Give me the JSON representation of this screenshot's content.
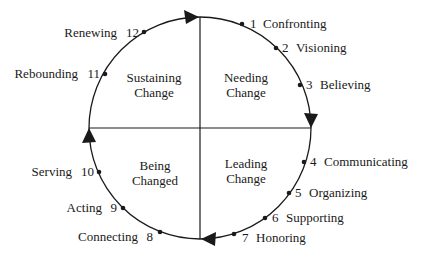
{
  "diagram": {
    "type": "change-cycle",
    "quadrants": [
      {
        "id": "needing",
        "line1": "Needing",
        "line2": "Change"
      },
      {
        "id": "leading",
        "line1": "Leading",
        "line2": "Change"
      },
      {
        "id": "being",
        "line1": "Being",
        "line2": "Changed"
      },
      {
        "id": "sustaining",
        "line1": "Sustaining",
        "line2": "Change"
      }
    ],
    "steps": [
      {
        "n": "1",
        "label": "Confronting"
      },
      {
        "n": "2",
        "label": "Visioning"
      },
      {
        "n": "3",
        "label": "Believing"
      },
      {
        "n": "4",
        "label": "Communicating"
      },
      {
        "n": "5",
        "label": "Organizing"
      },
      {
        "n": "6",
        "label": "Supporting"
      },
      {
        "n": "7",
        "label": "Honoring"
      },
      {
        "n": "8",
        "label": "Connecting"
      },
      {
        "n": "9",
        "label": "Acting"
      },
      {
        "n": "10",
        "label": "Serving"
      },
      {
        "n": "11",
        "label": "Rebounding"
      },
      {
        "n": "12",
        "label": "Renewing"
      }
    ],
    "colors": {
      "stroke": "#1a1a1a",
      "background": "#ffffff"
    }
  }
}
